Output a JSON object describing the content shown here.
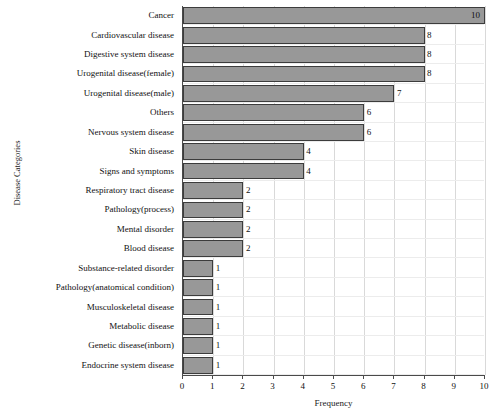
{
  "chart_data": {
    "type": "bar",
    "orientation": "horizontal",
    "title": "",
    "xlabel": "Frequency",
    "ylabel": "Disease Categories",
    "xlim": [
      0,
      10
    ],
    "xticks": [
      0,
      1,
      2,
      3,
      4,
      5,
      6,
      7,
      8,
      9,
      10
    ],
    "grid": true,
    "legend": false,
    "bar_color": "#989898",
    "bar_edge_color": "#3c3c3c",
    "categories": [
      "Cancer",
      "Cardiovascular disease",
      "Digestive system disease",
      "Urogenital disease(female)",
      "Urogenital disease(male)",
      "Others",
      "Nervous system disease",
      "Skin disease",
      "Signs and symptoms",
      "Respiratory tract disease",
      "Pathology(process)",
      "Mental disorder",
      "Blood disease",
      "Substance-related disorder",
      "Pathology(anatomical condition)",
      "Musculoskeletal disease",
      "Metabolic disease",
      "Genetic disease(inborn)",
      "Endocrine system disease"
    ],
    "values": [
      10,
      8,
      8,
      8,
      7,
      6,
      6,
      4,
      4,
      2,
      2,
      2,
      2,
      1,
      1,
      1,
      1,
      1,
      1
    ],
    "value_labels": [
      "10",
      "8",
      "8",
      "8",
      "7",
      "6",
      "6",
      "4",
      "4",
      "2",
      "2",
      "2",
      "2",
      "1",
      "1",
      "1",
      "1",
      "1",
      "1"
    ]
  }
}
